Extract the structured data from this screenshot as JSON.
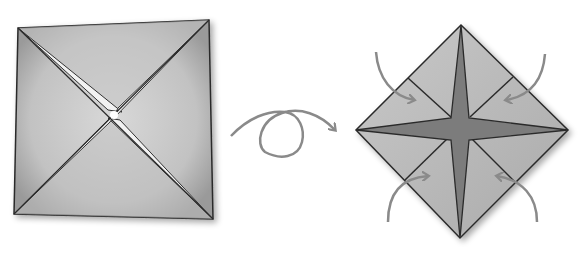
{
  "diagram": {
    "type": "origami-instruction",
    "steps": [
      {
        "id": "step-a",
        "label": "Square with diagonal creases folded toward center",
        "shape": "square"
      },
      {
        "id": "flip",
        "label": "Turn over",
        "symbol": "loop-arrow"
      },
      {
        "id": "step-b",
        "label": "Diamond with four corner flaps folded to center",
        "shape": "diamond",
        "arrows": 4
      }
    ],
    "colors": {
      "paper": "#bdbdbd",
      "paper_light": "#d4d4d4",
      "edge": "#2a2a2a",
      "center_star": "#7c7c7c",
      "arrow": "#8a8a8a",
      "slit": "#f4f4f4"
    }
  }
}
